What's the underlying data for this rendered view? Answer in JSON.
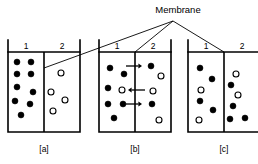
{
  "figure": {
    "title_label": "Membrane",
    "caption_a": "[a]",
    "caption_b": "[b]",
    "caption_c": "[c]",
    "compartment_left_label": "1",
    "compartment_right_label": "2",
    "colors": {
      "ink": "#000000",
      "background": "#ffffff",
      "solute_fill": "#000000",
      "solvent_fill": "#ffffff"
    }
  },
  "chart_data": {
    "type": "diagram",
    "title": "Membrane",
    "legend": [
      {
        "name": "filled-circle",
        "meaning": "solute particle",
        "fill": "#000000"
      },
      {
        "name": "open-circle",
        "meaning": "solvent particle",
        "fill": "#ffffff"
      }
    ],
    "panels": [
      {
        "id": "a",
        "caption": "[a]",
        "x": 8,
        "y": 40,
        "width": 72,
        "height": 92,
        "rim_y": 40,
        "liquid_y": 52,
        "membrane_x": 44,
        "left_label": "1",
        "right_label": "2",
        "left_label_x": 26,
        "right_label_x": 62,
        "label_y": 49,
        "filled_count_left": 9,
        "open_count_left": 0,
        "filled_count_right": 0,
        "open_count_right": 4,
        "particles": [
          {
            "type": "filled",
            "cx": 17,
            "cy": 62,
            "r": 3.0
          },
          {
            "type": "filled",
            "cx": 31,
            "cy": 62,
            "r": 3.0
          },
          {
            "type": "filled",
            "cx": 17,
            "cy": 74,
            "r": 3.0
          },
          {
            "type": "filled",
            "cx": 31,
            "cy": 74,
            "r": 3.0
          },
          {
            "type": "filled",
            "cx": 17,
            "cy": 87,
            "r": 3.0
          },
          {
            "type": "filled",
            "cx": 33,
            "cy": 92,
            "r": 3.0
          },
          {
            "type": "filled",
            "cx": 15,
            "cy": 101,
            "r": 3.0
          },
          {
            "type": "filled",
            "cx": 30,
            "cy": 104,
            "r": 3.0
          },
          {
            "type": "filled",
            "cx": 21,
            "cy": 115,
            "r": 3.0
          },
          {
            "type": "open",
            "cx": 61,
            "cy": 73,
            "r": 3.0
          },
          {
            "type": "open",
            "cx": 51,
            "cy": 92,
            "r": 3.0
          },
          {
            "type": "open",
            "cx": 65,
            "cy": 100,
            "r": 3.0
          },
          {
            "type": "open",
            "cx": 53,
            "cy": 111,
            "r": 3.0
          }
        ],
        "arrows": []
      },
      {
        "id": "b",
        "caption": "[b]",
        "x": 99,
        "y": 40,
        "width": 72,
        "height": 92,
        "rim_y": 40,
        "liquid_y": 52,
        "membrane_x": 135,
        "left_label": "1",
        "right_label": "2",
        "left_label_x": 117,
        "right_label_x": 153,
        "label_y": 49,
        "filled_count_left": 7,
        "open_count_left": 1,
        "filled_count_right": 2,
        "open_count_right": 3,
        "particles": [
          {
            "type": "filled",
            "cx": 110,
            "cy": 68,
            "r": 3.0
          },
          {
            "type": "filled",
            "cx": 124,
            "cy": 74,
            "r": 3.0
          },
          {
            "type": "filled",
            "cx": 108,
            "cy": 88,
            "r": 3.0
          },
          {
            "type": "open",
            "cx": 122,
            "cy": 90,
            "r": 3.0
          },
          {
            "type": "filled",
            "cx": 108,
            "cy": 104,
            "r": 3.0
          },
          {
            "type": "filled",
            "cx": 123,
            "cy": 104,
            "r": 3.0
          },
          {
            "type": "filled",
            "cx": 114,
            "cy": 118,
            "r": 3.0
          },
          {
            "type": "filled",
            "cx": 151,
            "cy": 66,
            "r": 3.0
          },
          {
            "type": "open",
            "cx": 161,
            "cy": 76,
            "r": 3.0
          },
          {
            "type": "open",
            "cx": 153,
            "cy": 91,
            "r": 3.0
          },
          {
            "type": "filled",
            "cx": 152,
            "cy": 104,
            "r": 3.0
          },
          {
            "type": "open",
            "cx": 159,
            "cy": 120,
            "r": 3.0
          }
        ],
        "arrows": [
          {
            "direction": "right",
            "x1": 126,
            "x2": 142,
            "y": 66
          },
          {
            "direction": "left",
            "x1": 145,
            "x2": 128,
            "y": 90
          },
          {
            "direction": "right",
            "x1": 126,
            "x2": 142,
            "y": 104
          }
        ]
      },
      {
        "id": "c",
        "caption": "[c]",
        "x": 188,
        "y": 40,
        "width": 72,
        "height": 92,
        "rim_y": 40,
        "liquid_y": 52,
        "membrane_x": 224,
        "left_label": "1",
        "right_label": "2",
        "left_label_x": 206,
        "right_label_x": 242,
        "label_y": 49,
        "filled_count_left": 4,
        "open_count_left": 2,
        "filled_count_right": 4,
        "open_count_right": 2,
        "particles": [
          {
            "type": "filled",
            "cx": 200,
            "cy": 68,
            "r": 3.0
          },
          {
            "type": "filled",
            "cx": 212,
            "cy": 79,
            "r": 3.0
          },
          {
            "type": "open",
            "cx": 201,
            "cy": 90,
            "r": 3.0
          },
          {
            "type": "filled",
            "cx": 200,
            "cy": 101,
            "r": 3.0
          },
          {
            "type": "filled",
            "cx": 213,
            "cy": 110,
            "r": 3.0
          },
          {
            "type": "open",
            "cx": 199,
            "cy": 120,
            "r": 3.0
          },
          {
            "type": "open",
            "cx": 236,
            "cy": 74,
            "r": 3.0
          },
          {
            "type": "filled",
            "cx": 231,
            "cy": 85,
            "r": 3.0
          },
          {
            "type": "open",
            "cx": 238,
            "cy": 95,
            "r": 3.0
          },
          {
            "type": "filled",
            "cx": 233,
            "cy": 106,
            "r": 3.0
          },
          {
            "type": "filled",
            "cx": 230,
            "cy": 119,
            "r": 3.0
          },
          {
            "type": "filled",
            "cx": 245,
            "cy": 118,
            "r": 3.0
          }
        ],
        "arrows": []
      }
    ],
    "leader_lines": [
      {
        "from": "Membrane",
        "x1": 173,
        "y1": 21,
        "x2": 44,
        "y2": 68
      },
      {
        "from": "Membrane",
        "x1": 173,
        "y1": 21,
        "x2": 135,
        "y2": 52
      },
      {
        "from": "Membrane",
        "x1": 173,
        "y1": 21,
        "x2": 224,
        "y2": 52
      }
    ],
    "title_position": {
      "x": 178,
      "y": 13
    }
  }
}
